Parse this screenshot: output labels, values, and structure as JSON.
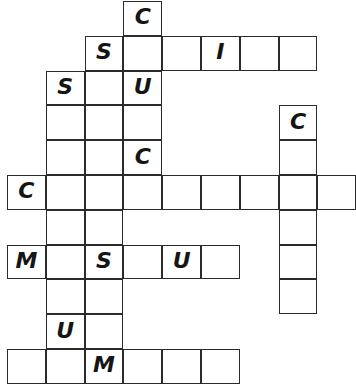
{
  "puzzle": {
    "title": "Crossword Grid",
    "type": "crossword",
    "grid": {
      "columns": 8,
      "rows": 10,
      "cell_width": 38.8,
      "cell_height": 34.8,
      "origin_x": 7,
      "origin_y": 1,
      "cell_fill_color": "#ffffff",
      "cell_border_color": "#2b2b2b",
      "letter_color": "#151515",
      "background_color": "#ffffff"
    },
    "entries": [
      {
        "name": "down-entry-col3",
        "direction": "down",
        "start_row": 0,
        "start_col": 3,
        "length": 5,
        "letters": [
          "C",
          "",
          "U",
          "",
          "C"
        ]
      },
      {
        "name": "across-entry-row1",
        "direction": "across",
        "start_row": 1,
        "start_col": 2,
        "length": 6,
        "letters": [
          "S",
          "",
          "",
          "I",
          "",
          ""
        ]
      },
      {
        "name": "down-entry-col1",
        "direction": "down",
        "start_row": 2,
        "start_col": 1,
        "length": 8,
        "letters": [
          "S",
          "",
          "",
          "",
          "",
          "",
          "U",
          ""
        ]
      },
      {
        "name": "down-entry-col2",
        "direction": "down",
        "start_row": 1,
        "start_col": 2,
        "length": 9,
        "letters": [
          "S",
          "",
          "",
          "",
          "",
          "",
          "S",
          "",
          "M"
        ]
      },
      {
        "name": "down-entry-col7",
        "direction": "down",
        "start_row": 3,
        "start_col": 7,
        "length": 6,
        "letters": [
          "C",
          "",
          "",
          "",
          "",
          ""
        ]
      },
      {
        "name": "across-entry-row5",
        "direction": "across",
        "start_row": 5,
        "start_col": 0,
        "length": 9,
        "letters": [
          "C",
          "",
          "",
          "",
          "",
          "",
          "",
          "",
          ""
        ]
      },
      {
        "name": "across-entry-row7",
        "direction": "across",
        "start_row": 7,
        "start_col": 0,
        "length": 6,
        "letters": [
          "M",
          "",
          "S",
          "",
          "U",
          ""
        ]
      },
      {
        "name": "across-entry-row9",
        "direction": "across",
        "start_row": 9,
        "start_col": 0,
        "length": 6,
        "letters": [
          "",
          "",
          "M",
          "",
          "",
          ""
        ]
      }
    ],
    "cells": [
      {
        "row": 0,
        "col": 3,
        "letter": "C"
      },
      {
        "row": 1,
        "col": 2,
        "letter": "S"
      },
      {
        "row": 1,
        "col": 3,
        "letter": ""
      },
      {
        "row": 1,
        "col": 4,
        "letter": ""
      },
      {
        "row": 1,
        "col": 5,
        "letter": "I"
      },
      {
        "row": 1,
        "col": 6,
        "letter": ""
      },
      {
        "row": 1,
        "col": 7,
        "letter": ""
      },
      {
        "row": 2,
        "col": 1,
        "letter": "S"
      },
      {
        "row": 2,
        "col": 2,
        "letter": ""
      },
      {
        "row": 2,
        "col": 3,
        "letter": "U"
      },
      {
        "row": 3,
        "col": 1,
        "letter": ""
      },
      {
        "row": 3,
        "col": 2,
        "letter": ""
      },
      {
        "row": 3,
        "col": 3,
        "letter": ""
      },
      {
        "row": 3,
        "col": 7,
        "letter": "C"
      },
      {
        "row": 4,
        "col": 1,
        "letter": ""
      },
      {
        "row": 4,
        "col": 2,
        "letter": ""
      },
      {
        "row": 4,
        "col": 3,
        "letter": "C"
      },
      {
        "row": 4,
        "col": 7,
        "letter": ""
      },
      {
        "row": 5,
        "col": 0,
        "letter": "C"
      },
      {
        "row": 5,
        "col": 1,
        "letter": ""
      },
      {
        "row": 5,
        "col": 2,
        "letter": ""
      },
      {
        "row": 5,
        "col": 3,
        "letter": ""
      },
      {
        "row": 5,
        "col": 4,
        "letter": ""
      },
      {
        "row": 5,
        "col": 5,
        "letter": ""
      },
      {
        "row": 5,
        "col": 6,
        "letter": ""
      },
      {
        "row": 5,
        "col": 7,
        "letter": ""
      },
      {
        "row": 5,
        "col": 8,
        "letter": ""
      },
      {
        "row": 6,
        "col": 1,
        "letter": ""
      },
      {
        "row": 6,
        "col": 2,
        "letter": ""
      },
      {
        "row": 6,
        "col": 7,
        "letter": ""
      },
      {
        "row": 7,
        "col": 0,
        "letter": "M"
      },
      {
        "row": 7,
        "col": 1,
        "letter": ""
      },
      {
        "row": 7,
        "col": 2,
        "letter": "S"
      },
      {
        "row": 7,
        "col": 3,
        "letter": ""
      },
      {
        "row": 7,
        "col": 4,
        "letter": "U"
      },
      {
        "row": 7,
        "col": 5,
        "letter": ""
      },
      {
        "row": 7,
        "col": 7,
        "letter": ""
      },
      {
        "row": 8,
        "col": 1,
        "letter": ""
      },
      {
        "row": 8,
        "col": 2,
        "letter": ""
      },
      {
        "row": 8,
        "col": 7,
        "letter": ""
      },
      {
        "row": 9,
        "col": 1,
        "letter": "U"
      },
      {
        "row": 9,
        "col": 2,
        "letter": ""
      },
      {
        "row": 10,
        "col": 0,
        "letter": ""
      },
      {
        "row": 10,
        "col": 1,
        "letter": ""
      },
      {
        "row": 10,
        "col": 2,
        "letter": "M"
      },
      {
        "row": 10,
        "col": 3,
        "letter": ""
      },
      {
        "row": 10,
        "col": 4,
        "letter": ""
      },
      {
        "row": 10,
        "col": 5,
        "letter": ""
      }
    ]
  }
}
